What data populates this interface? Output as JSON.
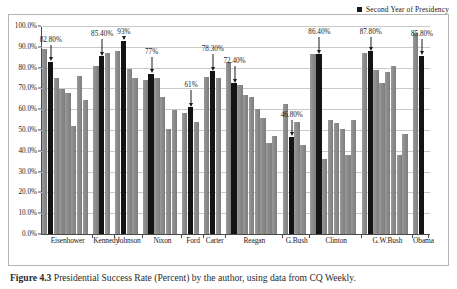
{
  "legend": {
    "items": [
      {
        "label": "Second Year of Presidency",
        "color": "#141414",
        "marker": "square-marker"
      }
    ]
  },
  "caption": {
    "figure_number": "Figure 4.3",
    "text": "Presidential Success Rate (Percent) by the author, using data from CQ Weekly."
  },
  "chart_data": {
    "type": "bar",
    "title": "",
    "subtitle": "",
    "xlabel": "",
    "ylabel": "",
    "ylim": [
      0,
      100
    ],
    "ytick_labels": [
      "0.0%",
      "10.0%",
      "20.0%",
      "30.0%",
      "40.0%",
      "50.0%",
      "60.0%",
      "70.0%",
      "80.0%",
      "90.0%",
      "100.0%"
    ],
    "ytick_values": [
      0,
      10,
      20,
      30,
      40,
      50,
      60,
      70,
      80,
      90,
      100
    ],
    "grid": true,
    "legend_position": "top-right",
    "highlight_series_name": "Second Year of Presidency",
    "highlight_color": "#141414",
    "bar_color": "#8c8c8c",
    "categories": [
      "Eisenhower",
      "Kennedy",
      "Johnson",
      "Nixon",
      "Ford",
      "Carter",
      "Reagan",
      "G.Bush",
      "Clinton",
      "G.W.Bush",
      "Obama"
    ],
    "groups": [
      {
        "name": "Eisenhower",
        "annotation": "82.80%",
        "highlight_index": 1,
        "values": [
          89.0,
          82.8,
          75.0,
          69.5,
          68.0,
          52.0,
          76.0,
          64.5
        ]
      },
      {
        "name": "Kennedy",
        "annotation": "85.40%",
        "highlight_index": 1,
        "values": [
          81.0,
          85.4,
          87.0
        ]
      },
      {
        "name": "Johnson",
        "annotation": "93%",
        "highlight_index": 1,
        "values": [
          88.0,
          93.0,
          79.5,
          75.0
        ]
      },
      {
        "name": "Nixon",
        "annotation": "77%",
        "highlight_index": 1,
        "values": [
          74.0,
          77.0,
          75.0,
          66.0,
          50.5,
          59.5
        ]
      },
      {
        "name": "Ford",
        "annotation": "61%",
        "highlight_index": 1,
        "values": [
          58.2,
          61.0,
          54.0
        ]
      },
      {
        "name": "Carter",
        "annotation": "78.30%",
        "highlight_index": 1,
        "values": [
          75.5,
          78.3,
          75.2
        ]
      },
      {
        "name": "Reagan",
        "annotation": "72.40%",
        "highlight_index": 1,
        "values": [
          82.5,
          72.4,
          71.5,
          67.0,
          65.8,
          60.0,
          56.0,
          43.8,
          47.3
        ]
      },
      {
        "name": "G.Bush",
        "annotation": "46.80%",
        "highlight_index": 1,
        "values": [
          62.5,
          46.8,
          54.0,
          43.0
        ]
      },
      {
        "name": "Clinton",
        "annotation": "86.40%",
        "highlight_index": 1,
        "values": [
          86.5,
          86.4,
          36.2,
          55.0,
          53.5,
          50.5,
          38.0,
          55.0
        ]
      },
      {
        "name": "G.W.Bush",
        "annotation": "87.80%",
        "highlight_index": 1,
        "values": [
          87.2,
          87.8,
          79.0,
          72.5,
          78.0,
          81.0,
          38.2,
          48.0
        ]
      },
      {
        "name": "Obama",
        "annotation": "85.80%",
        "highlight_index": 1,
        "values": [
          96.5,
          85.8
        ]
      }
    ]
  }
}
